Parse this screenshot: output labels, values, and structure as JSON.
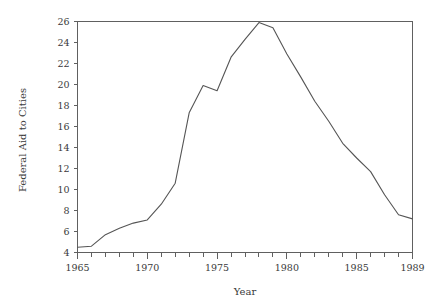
{
  "chart_data": {
    "type": "line",
    "title": "",
    "xlabel": "Year",
    "ylabel": "Federal Aid to Cities",
    "xlim": [
      1965,
      1989
    ],
    "ylim": [
      4,
      26
    ],
    "grid": false,
    "legend": null,
    "x_major_ticks": [
      1965,
      1970,
      1975,
      1980,
      1985,
      1989
    ],
    "x_major_tick_labels": [
      "1965",
      "1970",
      "1975",
      "1980",
      "1985",
      "1989"
    ],
    "x_minor_tick_interval": 1,
    "y_ticks": [
      4,
      6,
      8,
      10,
      12,
      14,
      16,
      18,
      20,
      22,
      24,
      26
    ],
    "y_tick_labels": [
      "4",
      "6",
      "8",
      "10",
      "12",
      "14",
      "16",
      "18",
      "20",
      "22",
      "24",
      "26"
    ],
    "line_color": "#555555",
    "x": [
      1965,
      1966,
      1967,
      1968,
      1969,
      1970,
      1971,
      1972,
      1973,
      1974,
      1975,
      1976,
      1977,
      1978,
      1979,
      1980,
      1981,
      1982,
      1983,
      1984,
      1985,
      1986,
      1987,
      1988,
      1989
    ],
    "values": [
      4.5,
      4.6,
      5.7,
      6.3,
      6.8,
      7.1,
      8.6,
      10.6,
      17.3,
      19.9,
      19.4,
      22.6,
      24.3,
      25.9,
      25.4,
      22.9,
      20.7,
      18.4,
      16.5,
      14.4,
      13.0,
      11.7,
      9.5,
      7.6,
      7.2
    ],
    "series": [
      {
        "name": "Federal Aid to Cities",
        "values": [
          4.5,
          4.6,
          5.7,
          6.3,
          6.8,
          7.1,
          8.6,
          10.6,
          17.3,
          19.9,
          19.4,
          22.6,
          24.3,
          25.9,
          25.4,
          22.9,
          20.7,
          18.4,
          16.5,
          14.4,
          13.0,
          11.7,
          9.5,
          7.6,
          7.2
        ]
      }
    ]
  },
  "axis_titles": {
    "x": "Year",
    "y": "Federal Aid to Cities"
  }
}
